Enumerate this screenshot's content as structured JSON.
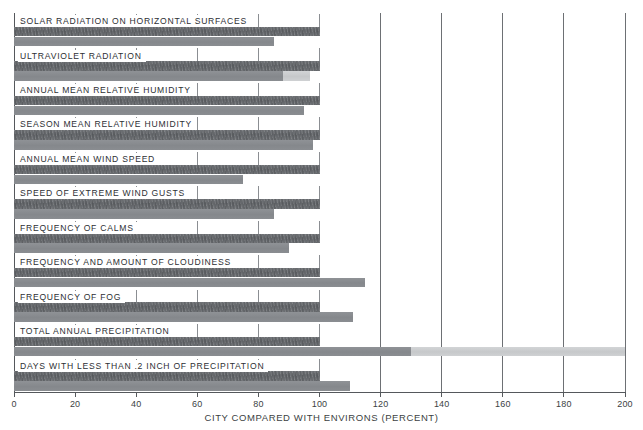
{
  "chart_data": {
    "type": "bar",
    "orientation": "horizontal",
    "title": "",
    "xlabel": "CITY COMPARED WITH ENVIRONS (PERCENT)",
    "ylabel": "",
    "xlim": [
      0,
      200
    ],
    "xticks": [
      0,
      20,
      40,
      60,
      80,
      100,
      120,
      140,
      160,
      180,
      200
    ],
    "xtick_labels": [
      "0",
      "20",
      "40",
      "60",
      "80",
      "100",
      "120",
      "140",
      "160",
      "180",
      "200"
    ],
    "grid": true,
    "legend": "none",
    "reference_value": 100,
    "categories": [
      "SOLAR RADIATION ON HORIZONTAL SURFACES",
      "ULTRAVIOLET RADIATION",
      "ANNUAL MEAN RELATIVE HUMIDITY",
      "SEASON MEAN RELATIVE HUMIDITY",
      "ANNUAL MEAN WIND SPEED",
      "SPEED OF EXTREME WIND GUSTS",
      "FREQUENCY OF CALMS",
      "FREQUENCY AND AMOUNT OF CLOUDINESS",
      "FREQUENCY OF FOG",
      "TOTAL ANNUAL PRECIPITATION",
      "DAYS WITH LESS THAN .2 INCH OF PRECIPITATION"
    ],
    "series": [
      {
        "name": "Environs reference",
        "tone": "dark",
        "values": [
          100,
          100,
          100,
          100,
          100,
          100,
          100,
          100,
          100,
          100,
          100
        ]
      },
      {
        "name": "City value (solid tone)",
        "tone": "medium",
        "values": [
          85,
          88,
          95,
          98,
          75,
          85,
          90,
          115,
          111,
          130,
          110
        ]
      },
      {
        "name": "City value (upper range)",
        "tone": "light",
        "values": [
          null,
          97,
          null,
          null,
          null,
          null,
          null,
          null,
          null,
          200,
          null
        ]
      }
    ],
    "rows": [
      {
        "label": "SOLAR RADIATION ON HORIZONTAL SURFACES",
        "ref": 100,
        "value": 85,
        "value_light": null
      },
      {
        "label": "ULTRAVIOLET RADIATION",
        "ref": 100,
        "value": 88,
        "value_light": 97
      },
      {
        "label": "ANNUAL MEAN RELATIVE HUMIDITY",
        "ref": 100,
        "value": 95,
        "value_light": null
      },
      {
        "label": "SEASON MEAN RELATIVE HUMIDITY",
        "ref": 100,
        "value": 98,
        "value_light": null
      },
      {
        "label": "ANNUAL MEAN WIND SPEED",
        "ref": 100,
        "value": 75,
        "value_light": null
      },
      {
        "label": "SPEED OF EXTREME WIND GUSTS",
        "ref": 100,
        "value": 85,
        "value_light": null
      },
      {
        "label": "FREQUENCY OF CALMS",
        "ref": 100,
        "value": 90,
        "value_light": null
      },
      {
        "label": "FREQUENCY AND AMOUNT OF CLOUDINESS",
        "ref": 100,
        "value": 115,
        "value_light": null
      },
      {
        "label": "FREQUENCY OF FOG",
        "ref": 100,
        "value": 111,
        "value_light": null
      },
      {
        "label": "TOTAL ANNUAL PRECIPITATION",
        "ref": 100,
        "value": 130,
        "value_light": 200
      },
      {
        "label": "DAYS WITH LESS THAN .2 INCH OF PRECIPITATION",
        "ref": 100,
        "value": 110,
        "value_light": null
      }
    ],
    "colors": {
      "reference_bar": "#63666a",
      "value_bar": "#8a8d91",
      "value_bar_light": "#cbcdcf",
      "axis": "#55585c",
      "grid": "#6d7074",
      "text": "#2d3034",
      "background": "#ffffff"
    }
  }
}
